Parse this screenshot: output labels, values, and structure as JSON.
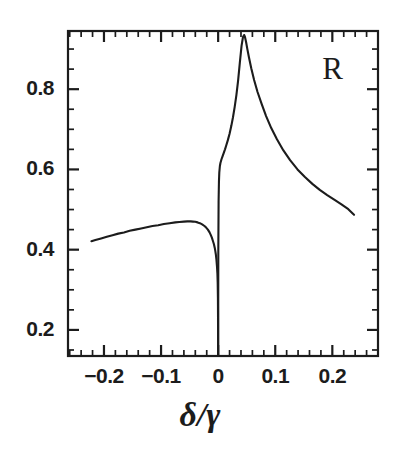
{
  "chart_data": {
    "type": "line",
    "title": "",
    "subtitle": "",
    "xlabel": "δ/γ",
    "ylabel": "",
    "annotation": "R",
    "annotations": [
      {
        "text": "R",
        "x": 0.2,
        "y": 0.84
      }
    ],
    "grid": false,
    "legend": null,
    "legend_position": "none",
    "xlim": [
      -0.263,
      0.28
    ],
    "ylim": [
      0.135,
      0.945
    ],
    "xticks": [
      -0.2,
      -0.1,
      0,
      0.1,
      0.2
    ],
    "xtick_labels": [
      "−0.2",
      "−0.1",
      "0",
      "0.1",
      "0.2"
    ],
    "xticks_minor_step": 0.02,
    "yticks": [
      0.2,
      0.4,
      0.6,
      0.8
    ],
    "ytick_labels": [
      "0.2",
      "0.4",
      "0.6",
      "0.8"
    ],
    "yticks_minor_step": 0.05,
    "line_color": "#1c1c1c",
    "line_width": 2.1,
    "series": [
      {
        "name": "R",
        "x": [
          -0.222,
          -0.215,
          -0.205,
          -0.195,
          -0.185,
          -0.175,
          -0.165,
          -0.155,
          -0.145,
          -0.135,
          -0.125,
          -0.115,
          -0.105,
          -0.095,
          -0.085,
          -0.075,
          -0.068,
          -0.06,
          -0.054,
          -0.048,
          -0.044,
          -0.04,
          -0.036,
          -0.032,
          -0.028,
          -0.024,
          -0.021,
          -0.018,
          -0.015,
          -0.013,
          -0.011,
          -0.009,
          -0.0075,
          -0.006,
          -0.005,
          -0.004,
          -0.003,
          -0.002,
          -0.0013,
          -0.0008,
          -0.0004,
          -0.0002,
          0.0
        ],
        "y": [
          0.421,
          0.424,
          0.428,
          0.432,
          0.436,
          0.44,
          0.443,
          0.447,
          0.45,
          0.453,
          0.456,
          0.459,
          0.461,
          0.464,
          0.466,
          0.468,
          0.469,
          0.47,
          0.4705,
          0.4705,
          0.47,
          0.4695,
          0.468,
          0.466,
          0.463,
          0.459,
          0.455,
          0.45,
          0.443,
          0.437,
          0.43,
          0.421,
          0.414,
          0.405,
          0.397,
          0.388,
          0.375,
          0.357,
          0.34,
          0.318,
          0.28,
          0.23,
          0.135
        ]
      },
      {
        "name": "R",
        "x": [
          0.0,
          0.0003,
          0.0008,
          0.0014,
          0.002,
          0.003,
          0.004,
          0.005,
          0.006,
          0.008,
          0.01,
          0.012,
          0.014,
          0.017,
          0.02,
          0.023,
          0.026,
          0.029,
          0.032,
          0.035,
          0.038,
          0.041,
          0.0435,
          0.0455,
          0.047,
          0.049,
          0.051,
          0.054,
          0.058,
          0.063,
          0.069,
          0.076,
          0.084,
          0.093,
          0.103,
          0.114,
          0.126,
          0.139,
          0.152,
          0.165,
          0.178,
          0.191,
          0.204,
          0.216,
          0.228,
          0.238
        ],
        "y": [
          0.135,
          0.4,
          0.52,
          0.57,
          0.592,
          0.608,
          0.616,
          0.621,
          0.626,
          0.634,
          0.642,
          0.65,
          0.659,
          0.673,
          0.689,
          0.708,
          0.73,
          0.756,
          0.786,
          0.822,
          0.866,
          0.908,
          0.93,
          0.935,
          0.93,
          0.917,
          0.901,
          0.879,
          0.852,
          0.823,
          0.793,
          0.764,
          0.733,
          0.703,
          0.675,
          0.648,
          0.623,
          0.6,
          0.581,
          0.564,
          0.549,
          0.536,
          0.524,
          0.513,
          0.501,
          0.487
        ]
      }
    ]
  },
  "axes": {
    "frame": {
      "left": 68,
      "right": 378,
      "top": 31,
      "bottom": 356
    },
    "frame_color": "#1c1c1c",
    "frame_width": 2.2,
    "tick_color": "#1c1c1c",
    "tick_major_length": 11,
    "tick_minor_length": 6
  },
  "labels": {
    "x_tick_texts": [
      "−0.2",
      "−0.1",
      "0",
      "0.1",
      "0.2"
    ],
    "y_tick_texts": [
      "0.8",
      "0.6",
      "0.4",
      "0.2"
    ],
    "axis_title_x": "δ/γ",
    "curve_label": "R"
  }
}
